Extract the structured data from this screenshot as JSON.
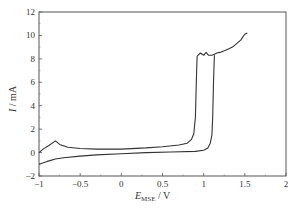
{
  "chart_data": {
    "type": "line",
    "title": "",
    "xlabel": "E_MSE / V",
    "xlabel_main": "E",
    "xlabel_sub": "MSE",
    "xlabel_unit": " / V",
    "ylabel": "I / mA",
    "ylabel_main": "I",
    "ylabel_unit": " / mA",
    "xlim": [
      -1,
      2
    ],
    "ylim": [
      -2,
      12
    ],
    "x_ticks": [
      -1,
      -0.5,
      0,
      0.5,
      1,
      1.5,
      2
    ],
    "x_tick_labels": [
      "-1",
      "-0.5",
      "0",
      "0.5",
      "1",
      "1.5",
      "2"
    ],
    "y_ticks": [
      -2,
      0,
      2,
      4,
      6,
      8,
      10,
      12
    ],
    "y_tick_labels": [
      "-2",
      "0",
      "2",
      "4",
      "6",
      "8",
      "10",
      "12"
    ],
    "grid": false,
    "legend": null,
    "series": [
      {
        "name": "forward scan",
        "x": [
          -1.0,
          -0.95,
          -0.88,
          -0.8,
          -0.75,
          -0.65,
          -0.5,
          -0.3,
          0.0,
          0.3,
          0.5,
          0.7,
          0.8,
          0.85,
          0.88,
          0.9,
          0.91,
          0.92,
          0.93,
          0.96,
          1.0,
          1.03,
          1.06,
          1.1,
          1.13,
          1.16,
          1.2,
          1.25,
          1.3,
          1.35,
          1.4,
          1.45,
          1.5,
          1.53
        ],
        "y": [
          0.0,
          0.3,
          0.6,
          1.0,
          0.7,
          0.45,
          0.35,
          0.3,
          0.3,
          0.4,
          0.5,
          0.65,
          0.8,
          1.1,
          1.6,
          3.0,
          6.0,
          8.2,
          8.3,
          8.5,
          8.3,
          8.55,
          8.3,
          8.3,
          8.4,
          8.5,
          8.55,
          8.7,
          8.85,
          9.0,
          9.3,
          9.6,
          10.1,
          10.2
        ]
      },
      {
        "name": "reverse scan",
        "x": [
          -1.0,
          -0.9,
          -0.8,
          -0.7,
          -0.5,
          -0.3,
          0.0,
          0.3,
          0.6,
          0.9,
          1.0,
          1.05,
          1.08,
          1.1,
          1.11,
          1.12,
          1.13
        ],
        "y": [
          -1.0,
          -0.75,
          -0.55,
          -0.45,
          -0.3,
          -0.2,
          -0.1,
          0.0,
          0.05,
          0.1,
          0.2,
          0.4,
          0.8,
          1.5,
          3.0,
          6.0,
          8.3
        ]
      }
    ]
  }
}
